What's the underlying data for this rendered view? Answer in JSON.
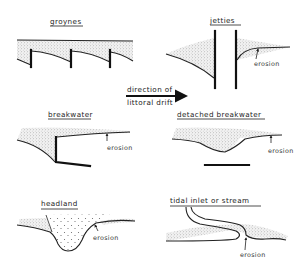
{
  "diagram": {
    "panels": [
      {
        "id": "groynes",
        "title": "groynes"
      },
      {
        "id": "jetties",
        "title": "jetties",
        "annotation": "erosion"
      },
      {
        "id": "breakwater",
        "title": "breakwater",
        "annotation": "erosion"
      },
      {
        "id": "detached-breakwater",
        "title": "detached breakwater",
        "annotation": "erosion"
      },
      {
        "id": "headland",
        "title": "headland",
        "annotation": "erosion"
      },
      {
        "id": "tidal-inlet",
        "title": "tidal inlet or stream",
        "annotation": "erosion"
      }
    ],
    "drift_arrow": {
      "line1": "direction of",
      "line2": "littoral drift",
      "direction": "right"
    },
    "colors": {
      "ink": "#222222",
      "structure": "#111111",
      "stipple": "#9a9a9a",
      "background": "#ffffff"
    }
  }
}
